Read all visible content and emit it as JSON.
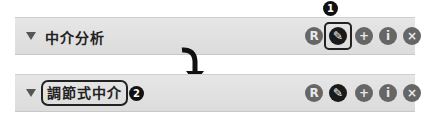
{
  "panel_before": {
    "title": "中介分析",
    "callout": "1",
    "buttons": [
      {
        "name": "r-button",
        "glyph": "R"
      },
      {
        "name": "edit-button",
        "glyph": "✎"
      },
      {
        "name": "add-button",
        "glyph": "+"
      },
      {
        "name": "info-button",
        "glyph": "i"
      },
      {
        "name": "remove-button",
        "glyph": "×"
      }
    ]
  },
  "panel_after": {
    "title": "調節式中介",
    "callout": "2",
    "buttons": [
      {
        "name": "r-button",
        "glyph": "R"
      },
      {
        "name": "edit-button",
        "glyph": "✎"
      },
      {
        "name": "add-button",
        "glyph": "+"
      },
      {
        "name": "info-button",
        "glyph": "i"
      },
      {
        "name": "remove-button",
        "glyph": "×"
      }
    ]
  }
}
